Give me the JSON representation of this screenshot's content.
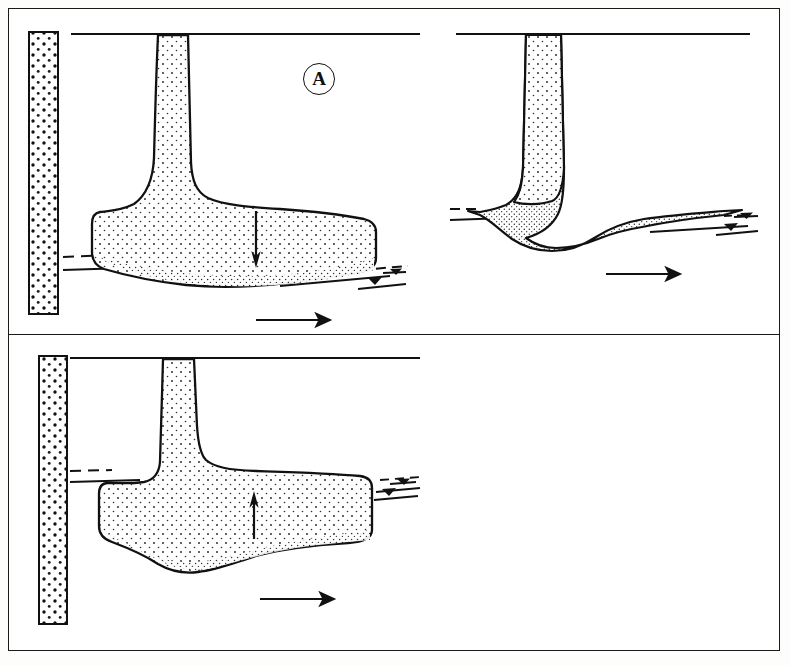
{
  "figure": {
    "type": "geological-cross-section-diagram",
    "panel_count": 3,
    "background_color": "#ffffff",
    "line_color": "#111111",
    "fill_color": "#ffffff",
    "stipple_color": "#222222"
  },
  "panels": [
    {
      "id": "A",
      "label": "A",
      "label_style": "circled-letter",
      "description": "Blunt thick tabular lobe with downward arrow",
      "arrow_direction": "down",
      "arrow_name": "down-arrow",
      "has_bedrock_column": true,
      "has_flow_arrow": true,
      "flow_arrow_direction": "right",
      "has_water_level_symbol": true,
      "water_level_symbol_count": 2,
      "has_dashed_bed_line": true,
      "stem_name": "feeder-conduit",
      "body_name": "deposit-lobe"
    },
    {
      "id": "B",
      "label": "B",
      "label_style": "circled-letter",
      "description": "Thin tapering wedge lobe pinching out downstream",
      "arrow_direction": "none",
      "arrow_name": "",
      "has_bedrock_column": false,
      "has_flow_arrow": true,
      "flow_arrow_direction": "right",
      "has_water_level_symbol": true,
      "water_level_symbol_count": 2,
      "has_dashed_bed_line": true,
      "stem_name": "feeder-conduit",
      "body_name": "deposit-wedge"
    },
    {
      "id": "C",
      "label": "C",
      "label_style": "circled-letter",
      "description": "Thick bulging lobe with upward arrow",
      "arrow_direction": "up",
      "arrow_name": "up-arrow",
      "has_bedrock_column": true,
      "has_flow_arrow": true,
      "flow_arrow_direction": "right",
      "has_water_level_symbol": true,
      "water_level_symbol_count": 2,
      "has_dashed_bed_line": true,
      "stem_name": "feeder-conduit",
      "body_name": "deposit-lobe"
    }
  ],
  "icons": {
    "water_level": "water-level-triangle-icon",
    "flow_arrow": "flow-direction-arrow-icon",
    "down_arrow": "downward-arrow-icon",
    "up_arrow": "upward-arrow-icon",
    "bedrock": "bedrock-column-icon"
  }
}
